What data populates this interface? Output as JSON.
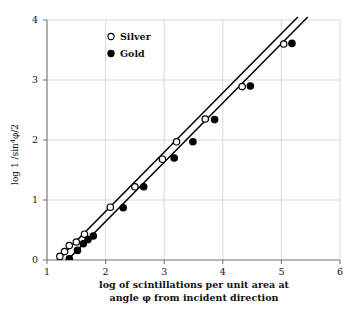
{
  "chart_data": {
    "type": "scatter",
    "title": "",
    "xlabel": "log of scintillations per unit area at angle φ from incident direction",
    "xlabel_line1": "log of scintillations per unit area at",
    "xlabel_line2": "angle φ from incident direction",
    "ylabel": "log 1 /sin⁴ φ/2",
    "ylabel_parts": {
      "prefix": "log  1 /sin",
      "exponent": "4",
      "suffix": "φ/2"
    },
    "xlim": [
      1,
      6
    ],
    "ylim": [
      0,
      4
    ],
    "xticks": [
      1,
      2,
      3,
      4,
      5,
      6
    ],
    "xtick_labels": [
      "1",
      "2",
      "3",
      "4",
      "5",
      "6"
    ],
    "yticks": [
      0,
      1,
      2,
      3,
      4
    ],
    "ytick_labels": [
      "0",
      "1",
      "2",
      "3",
      "4"
    ],
    "grid": true,
    "grid_color": "#c9c9c9",
    "axis_color": "#6f6f6f",
    "legend_position": "top-left-inside",
    "legend": [
      {
        "name": "Silver",
        "marker": "open-circle",
        "color": "#000000"
      },
      {
        "name": "Gold",
        "marker": "filled-circle",
        "color": "#000000"
      }
    ],
    "series": [
      {
        "name": "Silver",
        "marker": "open-circle",
        "color": "#000000",
        "points": [
          {
            "x": 1.22,
            "y": 0.06
          },
          {
            "x": 1.3,
            "y": 0.14
          },
          {
            "x": 1.38,
            "y": 0.24
          },
          {
            "x": 1.5,
            "y": 0.3
          },
          {
            "x": 1.64,
            "y": 0.43
          },
          {
            "x": 2.08,
            "y": 0.88
          },
          {
            "x": 2.5,
            "y": 1.22
          },
          {
            "x": 2.97,
            "y": 1.68
          },
          {
            "x": 3.21,
            "y": 1.97
          },
          {
            "x": 3.7,
            "y": 2.35
          },
          {
            "x": 4.33,
            "y": 2.89
          },
          {
            "x": 5.04,
            "y": 3.6
          }
        ],
        "fit_line": {
          "x1": 1.13,
          "y1": -0.05,
          "x2": 5.28,
          "y2": 4.05,
          "slope": 0.988,
          "intercept": -1.17
        }
      },
      {
        "name": "Gold",
        "marker": "filled-circle",
        "color": "#000000",
        "points": [
          {
            "x": 1.38,
            "y": 0.02
          },
          {
            "x": 1.52,
            "y": 0.16
          },
          {
            "x": 1.62,
            "y": 0.27
          },
          {
            "x": 1.7,
            "y": 0.34
          },
          {
            "x": 1.79,
            "y": 0.4
          },
          {
            "x": 2.3,
            "y": 0.87
          },
          {
            "x": 2.65,
            "y": 1.22
          },
          {
            "x": 3.17,
            "y": 1.7
          },
          {
            "x": 3.49,
            "y": 1.97
          },
          {
            "x": 3.86,
            "y": 2.34
          },
          {
            "x": 4.47,
            "y": 2.9
          },
          {
            "x": 5.18,
            "y": 3.61
          }
        ],
        "fit_line": {
          "x1": 1.3,
          "y1": -0.05,
          "x2": 5.45,
          "y2": 4.05,
          "slope": 0.988,
          "intercept": -1.34
        }
      }
    ]
  }
}
